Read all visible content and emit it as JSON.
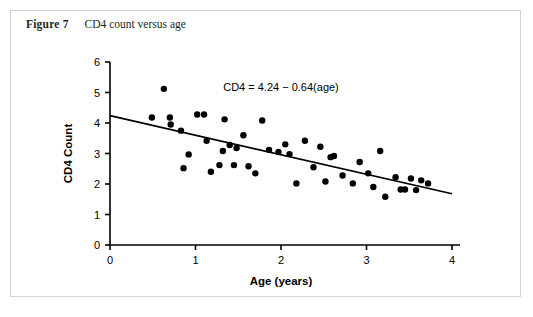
{
  "figure": {
    "number_label": "Figure 7",
    "caption": "CD4 count versus age"
  },
  "colors": {
    "border": "#d3d3d3",
    "background": "#ffffff",
    "ink": "#000000",
    "caption_ink": "#231f20"
  },
  "chart_data": {
    "type": "scatter",
    "title": "CD4 count versus age",
    "xlabel": "Age (years)",
    "ylabel": "CD4 Count",
    "xlim": [
      0,
      4
    ],
    "ylim": [
      0,
      6
    ],
    "xticks": [
      0,
      1,
      2,
      3,
      4
    ],
    "yticks": [
      0,
      1,
      2,
      3,
      4,
      5,
      6
    ],
    "xtick_labels": [
      "0",
      "1",
      "2",
      "3",
      "4"
    ],
    "ytick_labels": [
      "0",
      "1",
      "2",
      "3",
      "4",
      "5",
      "6"
    ],
    "grid": false,
    "legend": null,
    "annotations": [
      {
        "text": "CD4 = 4.24 − 0.64(age)",
        "x": 2.0,
        "y": 5.05
      }
    ],
    "fit_line": {
      "label": "CD4 = 4.24 − 0.64(age)",
      "intercept": 4.24,
      "slope": -0.64,
      "x_start": 0.0,
      "y_start": 4.24,
      "x_end": 4.0,
      "y_end": 1.68
    },
    "points": [
      {
        "x": 0.63,
        "y": 5.12
      },
      {
        "x": 0.49,
        "y": 4.18
      },
      {
        "x": 0.7,
        "y": 4.18
      },
      {
        "x": 0.71,
        "y": 3.95
      },
      {
        "x": 0.83,
        "y": 3.75
      },
      {
        "x": 0.92,
        "y": 2.97
      },
      {
        "x": 0.86,
        "y": 2.52
      },
      {
        "x": 1.02,
        "y": 4.28
      },
      {
        "x": 1.1,
        "y": 4.28
      },
      {
        "x": 1.13,
        "y": 3.42
      },
      {
        "x": 1.18,
        "y": 2.4
      },
      {
        "x": 1.28,
        "y": 2.62
      },
      {
        "x": 1.32,
        "y": 3.08
      },
      {
        "x": 1.34,
        "y": 4.12
      },
      {
        "x": 1.4,
        "y": 3.28
      },
      {
        "x": 1.45,
        "y": 2.62
      },
      {
        "x": 1.48,
        "y": 3.18
      },
      {
        "x": 1.56,
        "y": 3.6
      },
      {
        "x": 1.62,
        "y": 2.58
      },
      {
        "x": 1.7,
        "y": 2.35
      },
      {
        "x": 1.78,
        "y": 4.08
      },
      {
        "x": 1.86,
        "y": 3.12
      },
      {
        "x": 1.97,
        "y": 3.05
      },
      {
        "x": 2.05,
        "y": 3.3
      },
      {
        "x": 2.1,
        "y": 2.98
      },
      {
        "x": 2.18,
        "y": 2.02
      },
      {
        "x": 2.28,
        "y": 3.42
      },
      {
        "x": 2.38,
        "y": 2.55
      },
      {
        "x": 2.46,
        "y": 3.22
      },
      {
        "x": 2.52,
        "y": 2.08
      },
      {
        "x": 2.58,
        "y": 2.88
      },
      {
        "x": 2.62,
        "y": 2.92
      },
      {
        "x": 2.72,
        "y": 2.28
      },
      {
        "x": 2.84,
        "y": 2.02
      },
      {
        "x": 2.92,
        "y": 2.72
      },
      {
        "x": 3.02,
        "y": 2.35
      },
      {
        "x": 3.08,
        "y": 1.9
      },
      {
        "x": 3.16,
        "y": 3.08
      },
      {
        "x": 3.22,
        "y": 1.58
      },
      {
        "x": 3.34,
        "y": 2.22
      },
      {
        "x": 3.4,
        "y": 1.82
      },
      {
        "x": 3.45,
        "y": 1.82
      },
      {
        "x": 3.52,
        "y": 2.18
      },
      {
        "x": 3.58,
        "y": 1.8
      },
      {
        "x": 3.64,
        "y": 2.12
      },
      {
        "x": 3.72,
        "y": 2.02
      }
    ]
  }
}
